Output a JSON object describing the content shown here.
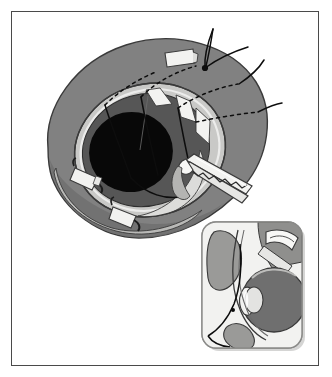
{
  "figure": {
    "domain": "Natural-Image",
    "kind": "medical-surgical-illustration",
    "caption": "Grayscale line-and-tone surgical drawing of an eye within the orbit, with sutures, white tissue clips and a serrated forceps, plus a rounded-rectangle inset showing a sagittal cross-section of the globe.",
    "background_color": "#ffffff",
    "frame": {
      "border_color": "#4a4a4a",
      "border_width_px": 1,
      "left": 11,
      "top": 11,
      "width": 308,
      "height": 355
    }
  },
  "palette": {
    "white": "#ffffff",
    "paper": "#fbfbfb",
    "highlight": "#f2f2f0",
    "light_gray": "#d9d9d7",
    "pale_gray": "#c9c9c7",
    "mid_light_gray": "#b3b3b1",
    "mid_gray": "#8a8a88",
    "tissue_gray": "#818181",
    "dark_gray": "#5e5e5e",
    "iris_gray": "#565656",
    "outline": "#3a3a3a",
    "black": "#0d0d0d",
    "pupil_black": "#080808"
  },
  "main_view": {
    "name": "orbital-anterior-view",
    "label": "Anterior view of eye in orbit",
    "orbit_mass": {
      "name": "orbital-tissue-mass",
      "fill": "#818181",
      "outline": "#3a3a3a",
      "description": "Large tilted ovoid of periorbital soft tissue"
    },
    "sclera": {
      "name": "sclera",
      "fill": "#c9c9c7",
      "description": "Pale ring of sclera exposed around the cornea"
    },
    "iris": {
      "name": "iris-ring",
      "fill": "#565656",
      "description": "Dark gray iris annulus"
    },
    "pupil": {
      "name": "pupil",
      "fill": "#080808",
      "description": "Black pupil, offset to the lower left"
    },
    "light_wedges": {
      "name": "scleral-wedge-segments",
      "fill": "#f2f2f0",
      "count": 3,
      "description": "Three light wedge-shaped scleral segments on the upper right limbus"
    },
    "lower_sclera": {
      "name": "lower-sclera-band",
      "fill": "#d9d9d7",
      "description": "Pale band of sclera along the lower limbus"
    }
  },
  "sutures": {
    "name": "suture-threads",
    "color": "#0d0d0d",
    "count": 4,
    "solid_description": "Black curved suture threads emerging above the orbit and crossing the globe",
    "dashed_description": "Dashed segments mark the sub-tissue (hidden) course of each suture",
    "dash_pattern": "3 4"
  },
  "clips": {
    "name": "tissue-clips",
    "fill": "#f2f2f0",
    "outline": "#3a3a3a",
    "count": 4,
    "description": "Small white rectangular tissue tags, each with a short dark hook"
  },
  "instrument": {
    "name": "serrated-forceps",
    "label": "Serrated forceps",
    "fill": "#f2f2f0",
    "outline": "#3a3a3a",
    "serration_count": 9,
    "description": "Forceps entering from lower right with a saw-tooth serrated lower jaw gripping tissue at the limbus"
  },
  "inset": {
    "name": "sagittal-inset",
    "label": "Sagittal cross-section of the globe",
    "box": {
      "left": 202,
      "top": 222,
      "width": 100,
      "height": 126,
      "corner_radius": 14,
      "fill": "#fbfbfb",
      "outline": "#8a8a88",
      "shadow": "#b3b3b1"
    },
    "parts": [
      {
        "name": "globe",
        "label": "Globe / vitreous chamber",
        "fill": "#6f6f6f"
      },
      {
        "name": "lens",
        "label": "Lens",
        "fill": "#e3e3e1"
      },
      {
        "name": "cornea",
        "label": "Cornea",
        "fill": "#f2f2f0"
      },
      {
        "name": "upper-eyelid",
        "label": "Upper eyelid",
        "fill": "#9a9a98"
      },
      {
        "name": "lower-eyelid",
        "label": "Lower eyelid",
        "fill": "#9a9a98"
      },
      {
        "name": "inset-suture",
        "label": "Suture in cross-section",
        "fill": "#0d0d0d"
      },
      {
        "name": "inset-instrument",
        "label": "Instrument tip",
        "fill": "#f2f2f0"
      }
    ]
  }
}
